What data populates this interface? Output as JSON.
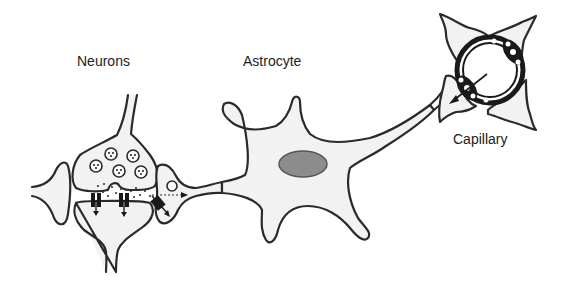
{
  "diagram": {
    "labels": {
      "neurons": "Neurons",
      "astrocyte": "Astrocyte",
      "capillary": "Capillary"
    },
    "elements": [
      "presynaptic-terminal",
      "postsynaptic-neuron",
      "synaptic-vesicles",
      "neurotransmitter-dots",
      "postsynaptic-receptors",
      "astrocyte-transporter",
      "astrocyte-body",
      "astrocyte-nucleus",
      "astrocyte-endfoot-process",
      "capillary-endothelium",
      "perivascular-endfeet"
    ],
    "colors": {
      "outline": "#2a2a2a",
      "cell_fill": "#f2f2f2",
      "nucleus_fill": "#8c8c8c",
      "background": "#ffffff"
    }
  }
}
